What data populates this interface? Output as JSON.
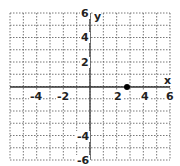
{
  "chart_data": {
    "type": "scatter",
    "title": "",
    "xlabel": "x",
    "ylabel": "y",
    "xlim": [
      -6,
      6
    ],
    "ylim": [
      -6,
      6
    ],
    "grid": true,
    "grid_style": "dotted",
    "grid_step": 1,
    "x_tick_labels": [
      "-4",
      "-2",
      "2",
      "4",
      "6"
    ],
    "y_tick_labels": [
      "6",
      "4",
      "2",
      "-4",
      "-6"
    ],
    "points": [
      {
        "x": 2.8,
        "y": 0
      }
    ],
    "colors": {
      "axis": "#333333",
      "grid": "#555555",
      "point": "#000000"
    }
  },
  "labels": {
    "x_axis": "x",
    "y_axis": "y",
    "xt_m4": "-4",
    "xt_m2": "-2",
    "xt_2": "2",
    "xt_4": "4",
    "xt_6": "6",
    "yt_6": "6",
    "yt_4": "4",
    "yt_2": "2",
    "yt_m4": "-4",
    "yt_m6": "-6"
  }
}
